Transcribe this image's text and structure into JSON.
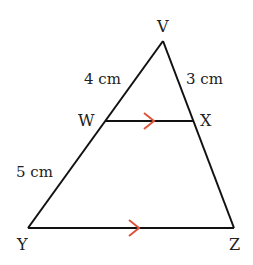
{
  "diagram": {
    "colors": {
      "line": "#111111",
      "arrow": "#e0553a",
      "text": "#222222"
    },
    "vertices": {
      "V": {
        "label": "V",
        "x": 163,
        "y": 41
      },
      "W": {
        "label": "W",
        "x": 105,
        "y": 121
      },
      "X": {
        "label": "X",
        "x": 194,
        "y": 121
      },
      "Y": {
        "label": "Y",
        "x": 28,
        "y": 228
      },
      "Z": {
        "label": "Z",
        "x": 234,
        "y": 228
      }
    },
    "lengths": {
      "VW": "4 cm",
      "VX": "3 cm",
      "WY": "5 cm"
    },
    "parallel_marks": [
      "WX",
      "YZ"
    ]
  }
}
